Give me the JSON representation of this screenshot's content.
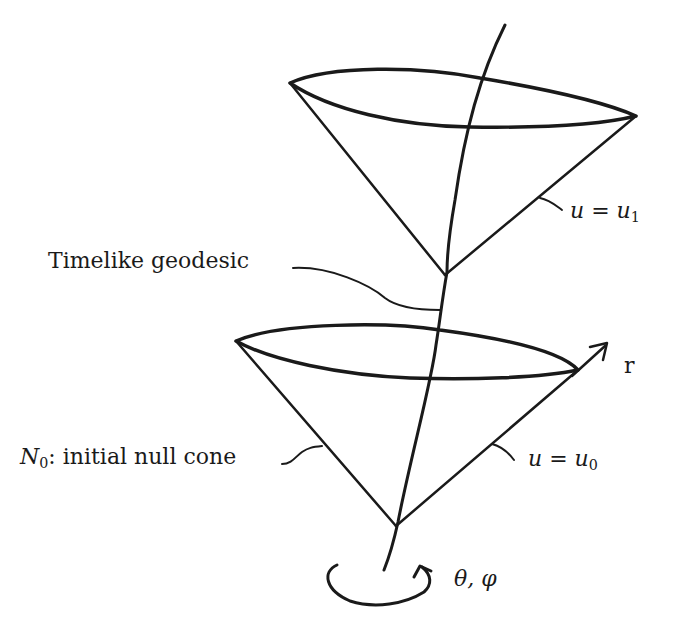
{
  "diagram": {
    "labels": {
      "timelike_geodesic": "Timelike geodesic",
      "initial_null_cone_prefix": "N",
      "initial_null_cone_sub": "0",
      "initial_null_cone_text": ": initial null cone",
      "upper_cone_u": "u = u",
      "upper_cone_sub": "1",
      "lower_cone_u": "u = u",
      "lower_cone_sub": "0",
      "radial_axis": "r",
      "angular_coords": "θ, φ"
    },
    "colors": {
      "ink": "#1a1a1a",
      "background": "#ffffff"
    }
  }
}
